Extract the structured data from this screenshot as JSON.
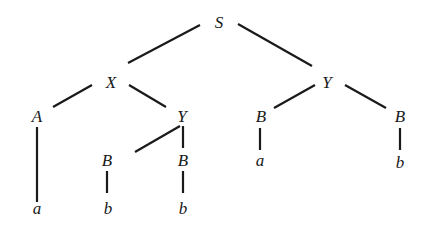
{
  "tree": {
    "nodes": [
      {
        "id": "S",
        "label": "S",
        "x": 219,
        "y": 22
      },
      {
        "id": "X",
        "label": "X",
        "x": 111,
        "y": 82
      },
      {
        "id": "Y1",
        "label": "Y",
        "x": 327,
        "y": 82
      },
      {
        "id": "A",
        "label": "A",
        "x": 37,
        "y": 116
      },
      {
        "id": "Y2",
        "label": "Y",
        "x": 182,
        "y": 116
      },
      {
        "id": "B1",
        "label": "B",
        "x": 261,
        "y": 116
      },
      {
        "id": "B2",
        "label": "B",
        "x": 400,
        "y": 116
      },
      {
        "id": "B3",
        "label": "B",
        "x": 107,
        "y": 160
      },
      {
        "id": "B4",
        "label": "B",
        "x": 183,
        "y": 160
      },
      {
        "id": "a1",
        "label": "a",
        "x": 37,
        "y": 208
      },
      {
        "id": "a2",
        "label": "a",
        "x": 260,
        "y": 160
      },
      {
        "id": "b1",
        "label": "b",
        "x": 400,
        "y": 162
      },
      {
        "id": "b2",
        "label": "b",
        "x": 108,
        "y": 208
      },
      {
        "id": "b3",
        "label": "b",
        "x": 183,
        "y": 208
      }
    ],
    "edges": [
      {
        "x1": 200,
        "y1": 25,
        "x2": 128,
        "y2": 63
      },
      {
        "x1": 238,
        "y1": 24,
        "x2": 312,
        "y2": 66
      },
      {
        "x1": 92,
        "y1": 85,
        "x2": 53,
        "y2": 107
      },
      {
        "x1": 129,
        "y1": 85,
        "x2": 166,
        "y2": 107
      },
      {
        "x1": 315,
        "y1": 85,
        "x2": 274,
        "y2": 108
      },
      {
        "x1": 345,
        "y1": 85,
        "x2": 386,
        "y2": 108
      },
      {
        "x1": 37,
        "y1": 127,
        "x2": 37,
        "y2": 202
      },
      {
        "x1": 180,
        "y1": 126,
        "x2": 135,
        "y2": 152
      },
      {
        "x1": 183,
        "y1": 126,
        "x2": 183,
        "y2": 148
      },
      {
        "x1": 107,
        "y1": 171,
        "x2": 107,
        "y2": 193
      },
      {
        "x1": 183,
        "y1": 171,
        "x2": 183,
        "y2": 193
      },
      {
        "x1": 260,
        "y1": 128,
        "x2": 260,
        "y2": 150
      },
      {
        "x1": 400,
        "y1": 128,
        "x2": 400,
        "y2": 150
      }
    ]
  }
}
